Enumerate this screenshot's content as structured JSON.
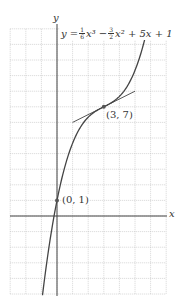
{
  "chart_data": {
    "type": "line",
    "title": "",
    "function": "y = (1/6)x^3 - (3/2)x^2 + 5x + 1",
    "xlabel": "x",
    "ylabel": "y",
    "xlim": [
      -3,
      7
    ],
    "ylim": [
      -5,
      12
    ],
    "grid": true,
    "grid_step": 1,
    "series": [
      {
        "name": "curve",
        "x": [
          -0.9,
          -0.5,
          0,
          0.5,
          1,
          1.5,
          2,
          2.5,
          3,
          3.5,
          4,
          4.5,
          5,
          5.5,
          5.85
        ],
        "y": [
          -4.83,
          -2.33,
          1,
          3.15,
          4.67,
          5.69,
          6.33,
          6.73,
          7,
          7.27,
          7.67,
          8.31,
          9.33,
          10.86,
          12.0
        ]
      },
      {
        "name": "tangent at (3,7)",
        "x": [
          1,
          5
        ],
        "y": [
          6,
          8
        ]
      }
    ],
    "points": [
      {
        "label": "(0, 1)",
        "x": 0,
        "y": 1
      },
      {
        "label": "(3, 7)",
        "x": 3,
        "y": 7
      }
    ]
  },
  "labels": {
    "x_axis": "x",
    "y_axis": "y",
    "eq_lhs": "y =",
    "eq_f1_num": "1",
    "eq_f1_den": "6",
    "eq_t1": "x³ −",
    "eq_f2_num": "3",
    "eq_f2_den": "2",
    "eq_t2": "x² + 5x + 1",
    "point_a": "(0, 1)",
    "point_b": "(3, 7)"
  },
  "colors": {
    "grid": "#bbbbbb",
    "axis": "#444444",
    "curve": "#444444",
    "point": "#555555"
  }
}
